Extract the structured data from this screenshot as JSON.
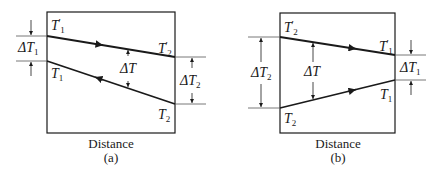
{
  "figure_a": {
    "caption": "(a)",
    "x_label": "Distance",
    "labels": {
      "top_left": {
        "sym": "T",
        "sub": "1",
        "prime": "′"
      },
      "top_right": {
        "sym": "T",
        "sub": "2",
        "prime": "′"
      },
      "bottom_left": {
        "sym": "T",
        "sub": "1"
      },
      "bottom_right": {
        "sym": "T",
        "sub": "2"
      },
      "delta_left": {
        "sym": "ΔT",
        "sub": "1"
      },
      "delta_mid": {
        "sym": "ΔT"
      },
      "delta_right": {
        "sym": "ΔT",
        "sub": "2"
      }
    },
    "flow": "counter-current"
  },
  "figure_b": {
    "caption": "(b)",
    "x_label": "Distance",
    "labels": {
      "top_left": {
        "sym": "T",
        "sub": "2",
        "prime": "′"
      },
      "top_right": {
        "sym": "T",
        "sub": "1",
        "prime": "′"
      },
      "bottom_left": {
        "sym": "T",
        "sub": "2"
      },
      "bottom_right": {
        "sym": "T",
        "sub": "1"
      },
      "delta_left": {
        "sym": "ΔT",
        "sub": "2"
      },
      "delta_mid": {
        "sym": "ΔT"
      },
      "delta_right": {
        "sym": "ΔT",
        "sub": "1"
      }
    },
    "flow": "co-current"
  },
  "colors": {
    "line": "#1a1a1a",
    "ext": "#555555"
  }
}
